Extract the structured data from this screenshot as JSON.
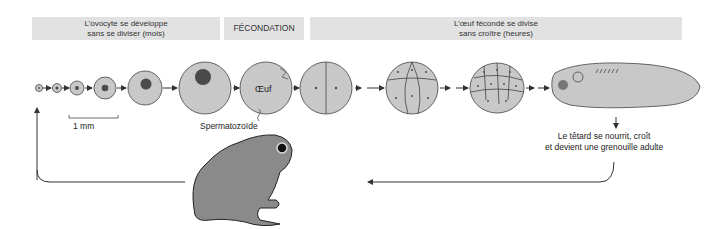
{
  "headers": {
    "oocyte": {
      "line1": "L’ovocyte se développe",
      "line2": "sans se diviser (mois)"
    },
    "fertilization": "FÉCONDATION",
    "cleavage": {
      "line1": "L’œuf fécondé se divise",
      "line2": "sans croître (heures)"
    }
  },
  "labels": {
    "scale": "1 mm",
    "egg": "Œuf",
    "sperm": "Spermatozoïde",
    "tadpole": {
      "line1": "Le têtard se nourrit, croît",
      "line2": "et devient une grenouille adulte"
    }
  },
  "stages": [
    "oocyte-1",
    "oocyte-2",
    "oocyte-3",
    "oocyte-4",
    "oocyte-5",
    "oocyte-6",
    "fertilized-egg",
    "two-cell",
    "eight-cell",
    "blastula",
    "tadpole",
    "adult-frog"
  ],
  "colors": {
    "cell_fill": "#c8c8c8",
    "nucleus": "#4a4a4a",
    "header_bg": "#e2e2e2",
    "line": "#333333"
  }
}
